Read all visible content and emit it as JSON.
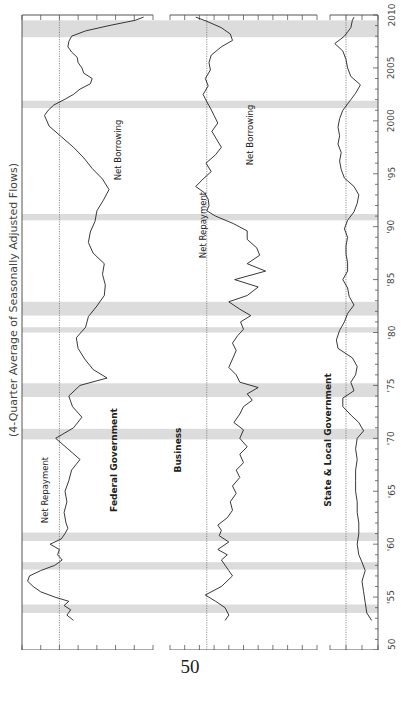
{
  "page": {
    "number": "50"
  },
  "chart_data": {
    "type": "line",
    "title": "(4-Quarter Average of Seasonally Adjusted Flows)",
    "orientation": "rotated-90-ccw",
    "x": {
      "label": "",
      "range": [
        1950,
        2010
      ],
      "ticks": [
        1950,
        1955,
        1960,
        1965,
        1970,
        1975,
        1980,
        1985,
        1990,
        1995,
        2000,
        2005,
        2010
      ],
      "tick_labels": [
        "1950",
        "'55",
        "'60",
        "'65",
        "'70",
        "'75",
        "'80",
        "'85",
        "'90",
        "'95",
        "2000",
        "2005",
        "2010"
      ]
    },
    "recessions": [
      [
        1953.5,
        1954.3
      ],
      [
        1957.6,
        1958.3
      ],
      [
        1960.3,
        1961.1
      ],
      [
        1969.9,
        1970.9
      ],
      [
        1973.9,
        1975.2
      ],
      [
        1980.0,
        1980.5
      ],
      [
        1981.6,
        1982.9
      ],
      [
        1990.6,
        1991.2
      ],
      [
        2001.2,
        2001.9
      ],
      [
        2007.9,
        2009.5
      ]
    ],
    "panels": [
      {
        "name": "Federal Government",
        "ylim": [
          -10,
          4
        ],
        "ticks": [
          4,
          2,
          0,
          -2,
          -4,
          -6,
          -8,
          -10
        ],
        "tick_labels": [
          "+4",
          "+2",
          "0",
          "−2",
          "−4",
          "−6",
          "−8",
          "−10"
        ],
        "annotations": [
          "Net Repayment",
          "Net Borrowing"
        ],
        "x": [
          1952.8,
          1953.3,
          1953.8,
          1954.2,
          1954.6,
          1955.0,
          1955.5,
          1956.0,
          1956.5,
          1957.0,
          1957.5,
          1958.0,
          1958.5,
          1959.0,
          1959.5,
          1960.0,
          1960.5,
          1961.0,
          1961.5,
          1962.0,
          1963.0,
          1964.0,
          1965.0,
          1966.0,
          1967.0,
          1968.0,
          1969.0,
          1970.0,
          1971.0,
          1972.0,
          1973.0,
          1974.0,
          1975.0,
          1975.7,
          1976.5,
          1977.5,
          1978.5,
          1979.5,
          1980.5,
          1981.5,
          1982.5,
          1983.5,
          1984.5,
          1985.5,
          1986.5,
          1987.5,
          1988.5,
          1989.5,
          1990.5,
          1991.5,
          1992.5,
          1993.5,
          1994.5,
          1995.5,
          1996.5,
          1997.5,
          1998.5,
          1999.5,
          2000.5,
          2001.0,
          2001.5,
          2002.0,
          2002.5,
          2003.0,
          2003.5,
          2004.0,
          2004.5,
          2005.0,
          2005.5,
          2006.0,
          2006.5,
          2007.0,
          2007.5,
          2008.0,
          2008.5,
          2009.0,
          2009.5,
          2009.8
        ],
        "y": [
          -1.5,
          -0.8,
          -1.2,
          -0.5,
          -1.0,
          0.5,
          2.0,
          2.8,
          3.4,
          3.2,
          2.0,
          0.5,
          -0.3,
          0.2,
          0.0,
          1.0,
          -0.2,
          -0.6,
          -0.9,
          -0.7,
          -0.5,
          -0.8,
          -0.6,
          -1.0,
          -1.3,
          -2.2,
          -0.9,
          0.4,
          -1.5,
          -2.4,
          -1.4,
          -1.0,
          -2.2,
          -5.1,
          -3.6,
          -2.7,
          -2.0,
          -1.8,
          -2.8,
          -3.1,
          -4.0,
          -4.8,
          -4.9,
          -4.6,
          -4.8,
          -3.6,
          -3.1,
          -3.3,
          -3.8,
          -4.0,
          -4.7,
          -5.3,
          -4.6,
          -3.5,
          -2.6,
          -1.5,
          -0.2,
          1.1,
          1.6,
          1.2,
          0.6,
          -0.5,
          -1.5,
          -2.2,
          -3.3,
          -3.5,
          -2.6,
          -2.4,
          -2.0,
          -1.9,
          -1.3,
          -0.9,
          -1.0,
          -1.3,
          -2.8,
          -5.3,
          -8.1,
          -9.0
        ]
      },
      {
        "name": "Business",
        "ylim": [
          -15,
          5
        ],
        "ticks": [],
        "tick_labels": [],
        "annotations": [
          "Net Repayment",
          "Net Borrowing"
        ],
        "x": [
          1952.8,
          1953.3,
          1954.0,
          1954.6,
          1955.2,
          1956.0,
          1957.0,
          1957.5,
          1958.0,
          1958.5,
          1959.0,
          1959.5,
          1960.2,
          1960.8,
          1961.3,
          1961.8,
          1962.5,
          1963.2,
          1964.0,
          1964.8,
          1965.5,
          1966.3,
          1967.0,
          1967.7,
          1968.5,
          1969.2,
          1970.0,
          1970.8,
          1971.5,
          1972.3,
          1973.0,
          1973.6,
          1974.2,
          1974.8,
          1975.3,
          1976.0,
          1976.7,
          1977.5,
          1978.3,
          1979.0,
          1979.7,
          1980.3,
          1981.0,
          1981.6,
          1982.2,
          1982.9,
          1983.5,
          1984.3,
          1985.0,
          1985.8,
          1986.5,
          1987.3,
          1988.0,
          1988.8,
          1989.6,
          1990.3,
          1991.0,
          1991.5,
          1992.0,
          1992.6,
          1993.2,
          1993.8,
          1994.5,
          1995.2,
          1996.0,
          1996.8,
          1997.5,
          1998.3,
          1999.0,
          1999.8,
          2000.5,
          2001.2,
          2001.8,
          2002.5,
          2003.3,
          2004.0,
          2004.8,
          2005.5,
          2006.2,
          2007.0,
          2007.6,
          2008.2,
          2008.8,
          2009.4,
          2009.8
        ],
        "y": [
          -2.5,
          -3.0,
          -2.5,
          -1.2,
          0.2,
          -2.0,
          -3.5,
          -3.0,
          -2.5,
          -2.0,
          -2.8,
          -1.5,
          -3.0,
          -1.7,
          -2.0,
          -1.5,
          -2.8,
          -3.5,
          -3.2,
          -4.0,
          -3.5,
          -4.5,
          -4.0,
          -5.0,
          -4.5,
          -5.5,
          -4.5,
          -5.0,
          -3.7,
          -4.5,
          -5.0,
          -6.2,
          -5.5,
          -7.0,
          -4.5,
          -4.0,
          -3.0,
          -3.5,
          -4.0,
          -3.5,
          -4.2,
          -5.0,
          -4.6,
          -6.0,
          -4.5,
          -3.0,
          -5.5,
          -7.0,
          -3.8,
          -8.0,
          -5.5,
          -7.2,
          -6.8,
          -5.5,
          -5.5,
          -3.6,
          -1.2,
          0.0,
          -0.3,
          -0.2,
          0.3,
          1.5,
          0.5,
          -0.6,
          0.1,
          -1.2,
          -2.0,
          -1.3,
          -0.7,
          -1.5,
          -1.0,
          -0.5,
          0.0,
          0.5,
          -0.2,
          0.2,
          -0.5,
          -0.3,
          -0.6,
          -2.0,
          -3.5,
          -3.2,
          -2.0,
          0.0,
          1.5
        ]
      },
      {
        "name": "State & Local Government",
        "ylim": [
          -2,
          1
        ],
        "ticks": [
          1,
          0,
          -1,
          -2
        ],
        "tick_labels": [
          "+1",
          "0",
          "−1",
          "−2"
        ],
        "annotations": [],
        "x": [
          1952.8,
          1953.5,
          1954.5,
          1955.5,
          1956.5,
          1957.5,
          1958.3,
          1959.0,
          1960.0,
          1961.0,
          1962.0,
          1963.0,
          1964.0,
          1965.0,
          1966.0,
          1967.0,
          1968.0,
          1969.0,
          1970.0,
          1970.7,
          1971.5,
          1972.2,
          1973.0,
          1973.8,
          1974.5,
          1975.3,
          1976.0,
          1976.8,
          1977.6,
          1978.5,
          1979.3,
          1980.2,
          1981.0,
          1981.8,
          1982.6,
          1983.4,
          1984.2,
          1985.0,
          1985.8,
          1986.6,
          1987.4,
          1988.2,
          1989.0,
          1989.8,
          1990.6,
          1991.4,
          1992.2,
          1993.0,
          1993.8,
          1994.6,
          1995.4,
          1996.2,
          1997.0,
          1997.8,
          1998.6,
          1999.4,
          2000.2,
          2001.0,
          2001.8,
          2002.6,
          2003.4,
          2004.2,
          2005.0,
          2005.8,
          2006.6,
          2007.3,
          2008.0,
          2008.8,
          2009.5,
          2009.8
        ],
        "y": [
          -1.6,
          -1.3,
          -1.2,
          -1.1,
          -1.0,
          -1.2,
          -1.0,
          -0.8,
          -0.7,
          -0.8,
          -0.8,
          -0.7,
          -0.7,
          -0.6,
          -0.6,
          -0.6,
          -0.7,
          -0.6,
          -0.7,
          -1.1,
          -0.8,
          -0.3,
          0.2,
          0.2,
          -0.5,
          -0.3,
          -0.6,
          -0.7,
          -0.4,
          0.5,
          0.6,
          0.4,
          0.1,
          -0.1,
          -0.5,
          -0.2,
          -0.1,
          0.2,
          -0.1,
          -0.1,
          0.0,
          0.0,
          -0.1,
          0.1,
          -0.1,
          -0.5,
          -0.7,
          -0.8,
          -0.5,
          0.1,
          0.3,
          0.4,
          0.3,
          0.5,
          0.4,
          0.5,
          0.4,
          0.2,
          -0.2,
          -0.6,
          -0.9,
          -0.3,
          -0.1,
          0.0,
          0.2,
          0.7,
          0.1,
          -0.3,
          -0.4,
          -0.5
        ]
      }
    ]
  }
}
